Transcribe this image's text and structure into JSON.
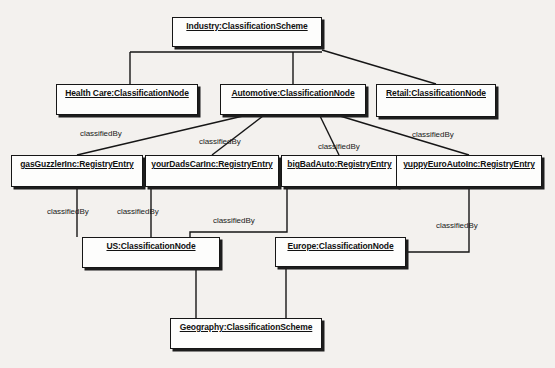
{
  "diagram": {
    "type": "uml-object-diagram",
    "background_color": "#f3f1ee",
    "box_fill_color": "#fdfdfc",
    "line_color": "#161616",
    "nodes": [
      {
        "id": "industry",
        "label": "Industry:ClassificationScheme",
        "stereotype": "ClassificationScheme",
        "instance": "Industry",
        "x": 172,
        "y": 17,
        "w": 150,
        "h": 30
      },
      {
        "id": "healthcare",
        "label": "Health Care:ClassificationNode",
        "stereotype": "ClassificationNode",
        "instance": "Health Care",
        "x": 56,
        "y": 84,
        "w": 142,
        "h": 31
      },
      {
        "id": "automotive",
        "label": "Automotive:ClassificationNode",
        "stereotype": "ClassificationNode",
        "instance": "Automotive",
        "x": 220,
        "y": 84,
        "w": 146,
        "h": 31
      },
      {
        "id": "retail",
        "label": "Retail:ClassificationNode",
        "stereotype": "ClassificationNode",
        "instance": "Retail",
        "x": 376,
        "y": 84,
        "w": 120,
        "h": 33
      },
      {
        "id": "gasguzzler",
        "label": "gasGuzzlerInc:RegistryEntry",
        "stereotype": "RegistryEntry",
        "instance": "gasGuzzlerInc",
        "x": 11,
        "y": 155,
        "w": 132,
        "h": 32
      },
      {
        "id": "yourdadscar",
        "label": "yourDadsCarInc:RegistryEntry",
        "stereotype": "RegistryEntry",
        "instance": "yourDadsCarInc",
        "x": 145,
        "y": 155,
        "w": 134,
        "h": 32
      },
      {
        "id": "bigbadauto",
        "label": "bigBadAuto:RegistryEntry",
        "stereotype": "RegistryEntry",
        "instance": "bigBadAuto",
        "x": 281,
        "y": 155,
        "w": 117,
        "h": 32
      },
      {
        "id": "yuppyeuroauto",
        "label": "yuppyEuroAutoInc:RegistryEntry",
        "stereotype": "RegistryEntry",
        "instance": "yuppyEuroAutoInc",
        "x": 396,
        "y": 155,
        "w": 146,
        "h": 32
      },
      {
        "id": "us",
        "label": "US:ClassificationNode",
        "stereotype": "ClassificationNode",
        "instance": "US",
        "x": 82,
        "y": 237,
        "w": 138,
        "h": 31
      },
      {
        "id": "europe",
        "label": "Europe:ClassificationNode",
        "stereotype": "ClassificationNode",
        "instance": "Europe",
        "x": 275,
        "y": 237,
        "w": 131,
        "h": 30
      },
      {
        "id": "geography",
        "label": "Geography:ClassificationScheme",
        "stereotype": "ClassificationScheme",
        "instance": "Geography",
        "x": 170,
        "y": 318,
        "w": 152,
        "h": 31
      }
    ],
    "edge_label_text": "classifiedBy",
    "edges": [
      {
        "from": "healthcare",
        "to": "industry",
        "label": "",
        "kind": "tree"
      },
      {
        "from": "automotive",
        "to": "industry",
        "label": "",
        "kind": "tree"
      },
      {
        "from": "retail",
        "to": "industry",
        "label": "",
        "kind": "diagonal"
      },
      {
        "from": "gasguzzler",
        "to": "automotive",
        "label": "classifiedBy",
        "kind": "diagonal"
      },
      {
        "from": "yourdadscar",
        "to": "automotive",
        "label": "classifiedBy",
        "kind": "vertical"
      },
      {
        "from": "bigbadauto",
        "to": "automotive",
        "label": "classifiedBy",
        "kind": "vertical"
      },
      {
        "from": "yuppyeuroauto",
        "to": "automotive",
        "label": "classifiedBy",
        "kind": "diagonal"
      },
      {
        "from": "us",
        "to": "gasguzzler",
        "label": "classifiedBy",
        "kind": "vertical"
      },
      {
        "from": "us",
        "to": "yourdadscar",
        "label": "classifiedBy",
        "kind": "vertical"
      },
      {
        "from": "us",
        "to": "bigbadauto",
        "label": "classifiedBy",
        "kind": "orthogonal"
      },
      {
        "from": "europe",
        "to": "yuppyeuroauto",
        "label": "classifiedBy",
        "kind": "orthogonal"
      },
      {
        "from": "geography",
        "to": "us",
        "label": "",
        "kind": "vertical"
      },
      {
        "from": "geography",
        "to": "europe",
        "label": "",
        "kind": "orthogonal"
      }
    ],
    "edge_labels": [
      {
        "text": "classifiedBy",
        "x": 80,
        "y": 129
      },
      {
        "text": "classifiedBy",
        "x": 199,
        "y": 137
      },
      {
        "text": "classifiedBy",
        "x": 318,
        "y": 142
      },
      {
        "text": "classifiedBy",
        "x": 412,
        "y": 130
      },
      {
        "text": "classifiedBy",
        "x": 47,
        "y": 207
      },
      {
        "text": "classifiedBy",
        "x": 117,
        "y": 207
      },
      {
        "text": "classifiedBy",
        "x": 213,
        "y": 216
      },
      {
        "text": "classifiedBy",
        "x": 436,
        "y": 221
      }
    ]
  }
}
